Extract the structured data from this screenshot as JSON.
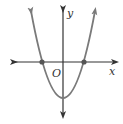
{
  "diagram": {
    "type": "parabola-graph",
    "axes": {
      "x_label": "x",
      "y_label": "y",
      "origin_label": "O"
    },
    "curve": {
      "shape": "upward parabola",
      "x_intercepts": 2,
      "vertex": "below origin on y-axis"
    },
    "colors": {
      "axis": "#333333",
      "curve": "#7a7a7a",
      "point": "#555555"
    }
  }
}
